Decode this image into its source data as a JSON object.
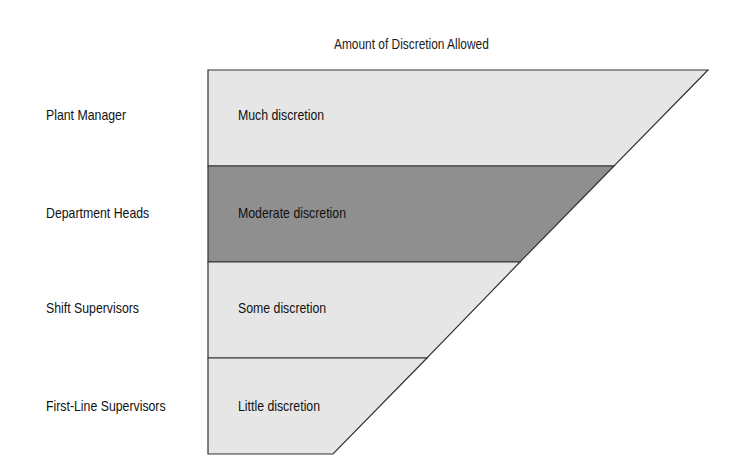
{
  "diagram": {
    "title": "Amount of Discretion Allowed",
    "colors": {
      "light": "#e6e6e6",
      "dark": "#8f8f8f",
      "stroke": "#333333"
    },
    "levels": [
      {
        "role": "Plant Manager",
        "discretion": "Much discretion",
        "shade": "light"
      },
      {
        "role": "Department Heads",
        "discretion": "Moderate discretion",
        "shade": "dark"
      },
      {
        "role": "Shift Supervisors",
        "discretion": "Some discretion",
        "shade": "light"
      },
      {
        "role": "First-Line Supervisors",
        "discretion": "Little discretion",
        "shade": "light"
      }
    ]
  }
}
